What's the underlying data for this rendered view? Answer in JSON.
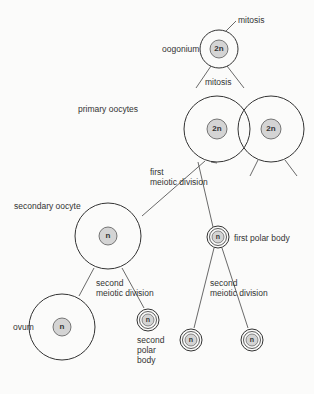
{
  "diagram": {
    "colors": {
      "line": "#333333",
      "nucleus_fill": "#d4d4d4",
      "background": "#fbfbfa"
    },
    "labels": {
      "mitosis_top": "mitosis",
      "oogonium": "oogonium",
      "mitosis_mid": "mitosis",
      "primary_oocytes": "primary oocytes",
      "first_meiotic_1": "first",
      "first_meiotic_2": "meiotic division",
      "secondary_oocyte": "secondary oocyte",
      "first_polar_body": "first polar body",
      "second_meiotic_left_1": "second",
      "second_meiotic_left_2": "meiotic division",
      "second_meiotic_right_1": "second",
      "second_meiotic_right_2": "meiotic division",
      "ovum": "ovum",
      "second_polar_body_1": "second",
      "second_polar_body_2": "polar",
      "second_polar_body_3": "body"
    },
    "nuclei": {
      "oogonium": "2n",
      "primary_oocyte_left": "2n",
      "primary_oocyte_right": "2n",
      "secondary_oocyte": "n",
      "first_polar_body": "n",
      "ovum": "n",
      "second_polar_body": "n",
      "polar_body_bottom_left": "n",
      "polar_body_bottom_right": "n"
    }
  }
}
